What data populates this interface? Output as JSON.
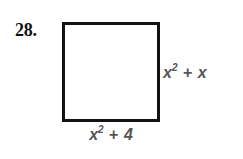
{
  "figure": {
    "problem_number": "28.",
    "shape": "square",
    "fill_color": "#ffffff",
    "stroke_color": "#121212",
    "label_color": "#555555",
    "labels": {
      "right": {
        "full_text": "x² + x",
        "base": "x",
        "exponent": "2",
        "operator": "+",
        "term": "x"
      },
      "bottom": {
        "full_text": "x² + 4",
        "base": "x",
        "exponent": "2",
        "operator": "+",
        "term": "4"
      }
    }
  }
}
